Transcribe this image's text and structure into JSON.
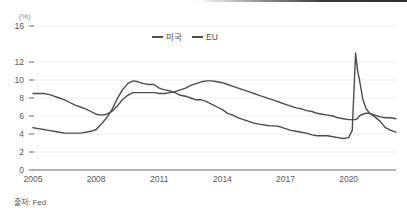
{
  "figure": {
    "unit_label": "(%)",
    "source_note": "출처: Fed"
  },
  "legend": {
    "position": "top-center",
    "items": [
      {
        "label": "미국",
        "color": "#4d4d4d"
      },
      {
        "label": "EU",
        "color": "#4d4d4d"
      }
    ]
  },
  "axes": {
    "y_ticks": [
      "16",
      "12",
      "10",
      "8",
      "6",
      "4",
      "2",
      "0"
    ],
    "x_ticks": [
      "2005",
      "2008",
      "2011",
      "2014",
      "2017",
      "2020"
    ]
  },
  "chart_data": {
    "type": "line",
    "title": "",
    "subtitle": "",
    "xlabel": "",
    "ylabel": "(%)",
    "ylim": [
      0,
      16
    ],
    "xlim": [
      2005,
      2022.25
    ],
    "grid": true,
    "grid_axis": "y",
    "legend_position": "top-center",
    "y_tick_values": [
      0,
      2,
      4,
      6,
      8,
      10,
      12,
      16
    ],
    "y_tick_labels": [
      "0",
      "2",
      "4",
      "6",
      "8",
      "10",
      "12",
      "16"
    ],
    "x_tick_values": [
      2005,
      2008,
      2011,
      2014,
      2017,
      2020
    ],
    "x_tick_labels": [
      "2005",
      "2008",
      "2011",
      "2014",
      "2017",
      "2020"
    ],
    "annotations": [
      "출처: Fed"
    ],
    "x": [
      2005.0,
      2005.25,
      2005.5,
      2005.75,
      2006.0,
      2006.25,
      2006.5,
      2006.75,
      2007.0,
      2007.25,
      2007.5,
      2007.75,
      2008.0,
      2008.25,
      2008.5,
      2008.75,
      2009.0,
      2009.25,
      2009.5,
      2009.75,
      2010.0,
      2010.25,
      2010.5,
      2010.75,
      2011.0,
      2011.25,
      2011.5,
      2011.75,
      2012.0,
      2012.25,
      2012.5,
      2012.75,
      2013.0,
      2013.25,
      2013.5,
      2013.75,
      2014.0,
      2014.25,
      2014.5,
      2014.75,
      2015.0,
      2015.25,
      2015.5,
      2015.75,
      2016.0,
      2016.25,
      2016.5,
      2016.75,
      2017.0,
      2017.25,
      2017.5,
      2017.75,
      2018.0,
      2018.25,
      2018.5,
      2018.75,
      2019.0,
      2019.25,
      2019.5,
      2019.75,
      2020.0,
      2020.17,
      2020.33,
      2020.42,
      2020.5,
      2020.67,
      2020.83,
      2021.0,
      2021.25,
      2021.5,
      2021.75,
      2022.0,
      2022.25
    ],
    "series": [
      {
        "name": "미국",
        "color": "#4d4d4d",
        "values": [
          4.7,
          4.6,
          4.5,
          4.4,
          4.3,
          4.2,
          4.1,
          4.1,
          4.1,
          4.1,
          4.2,
          4.3,
          4.5,
          5.1,
          5.8,
          6.7,
          7.9,
          8.9,
          9.6,
          9.9,
          9.8,
          9.6,
          9.5,
          9.5,
          9.1,
          8.9,
          8.8,
          8.6,
          8.3,
          8.2,
          8.0,
          7.8,
          7.8,
          7.6,
          7.3,
          7.0,
          6.7,
          6.3,
          6.1,
          5.8,
          5.6,
          5.4,
          5.2,
          5.1,
          5.0,
          4.9,
          4.9,
          4.8,
          4.6,
          4.4,
          4.3,
          4.2,
          4.1,
          3.9,
          3.8,
          3.8,
          3.8,
          3.7,
          3.6,
          3.5,
          3.6,
          4.4,
          13.0,
          11.1,
          10.2,
          7.9,
          6.8,
          6.3,
          5.9,
          5.4,
          4.7,
          4.4,
          4.2
        ]
      },
      {
        "name": "EU",
        "color": "#4d4d4d",
        "values": [
          8.5,
          8.5,
          8.5,
          8.4,
          8.2,
          8.0,
          7.8,
          7.5,
          7.2,
          7.0,
          6.8,
          6.5,
          6.2,
          6.1,
          6.2,
          6.5,
          7.1,
          7.8,
          8.3,
          8.6,
          8.6,
          8.6,
          8.6,
          8.6,
          8.5,
          8.5,
          8.6,
          8.7,
          8.9,
          9.1,
          9.4,
          9.6,
          9.8,
          9.9,
          9.9,
          9.8,
          9.7,
          9.5,
          9.3,
          9.1,
          8.9,
          8.7,
          8.5,
          8.3,
          8.1,
          7.9,
          7.7,
          7.5,
          7.3,
          7.1,
          6.9,
          6.8,
          6.6,
          6.5,
          6.3,
          6.2,
          6.1,
          6.0,
          5.8,
          5.7,
          5.6,
          5.6,
          5.6,
          5.7,
          6.0,
          6.2,
          6.3,
          6.3,
          6.1,
          5.9,
          5.8,
          5.8,
          5.7
        ]
      }
    ]
  }
}
